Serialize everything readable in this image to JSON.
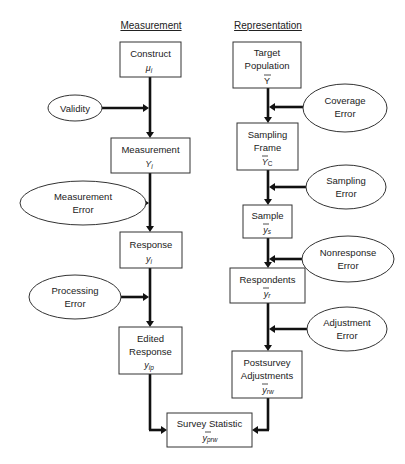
{
  "headers": {
    "measurement": "Measurement",
    "representation": "Representation"
  },
  "measurement_side": {
    "construct": {
      "label": "Construct",
      "symbol": "μ",
      "subscript": "i"
    },
    "validity": {
      "label": "Validity"
    },
    "measurement": {
      "label": "Measurement",
      "symbol": "Y",
      "subscript": "i"
    },
    "measurement_error": {
      "line1": "Measurement",
      "line2": "Error"
    },
    "response": {
      "label": "Response",
      "symbol": "y",
      "subscript": "i"
    },
    "processing_error": {
      "line1": "Processing",
      "line2": "Error"
    },
    "edited_response": {
      "line1": "Edited",
      "line2": "Response",
      "symbol": "y",
      "subscript": "ip"
    }
  },
  "representation_side": {
    "target_population": {
      "line1": "Target",
      "line2": "Population",
      "symbol": "Y"
    },
    "coverage_error": {
      "line1": "Coverage",
      "line2": "Error"
    },
    "sampling_frame": {
      "line1": "Sampling",
      "line2": "Frame",
      "symbol": "Y",
      "subscript": "C"
    },
    "sampling_error": {
      "line1": "Sampling",
      "line2": "Error"
    },
    "sample": {
      "label": "Sample",
      "symbol": "y",
      "subscript": "s"
    },
    "nonresponse_error": {
      "line1": "Nonresponse",
      "line2": "Error"
    },
    "respondents": {
      "label": "Respondents",
      "symbol": "y",
      "subscript": "r"
    },
    "adjustment_error": {
      "line1": "Adjustment",
      "line2": "Error"
    },
    "postsurvey_adjustments": {
      "line1": "Postsurvey",
      "line2": "Adjustments",
      "symbol": "y",
      "subscript": "rw"
    }
  },
  "result": {
    "survey_statistic": {
      "label": "Survey Statistic",
      "symbol": "y",
      "subscript": "prw"
    }
  }
}
